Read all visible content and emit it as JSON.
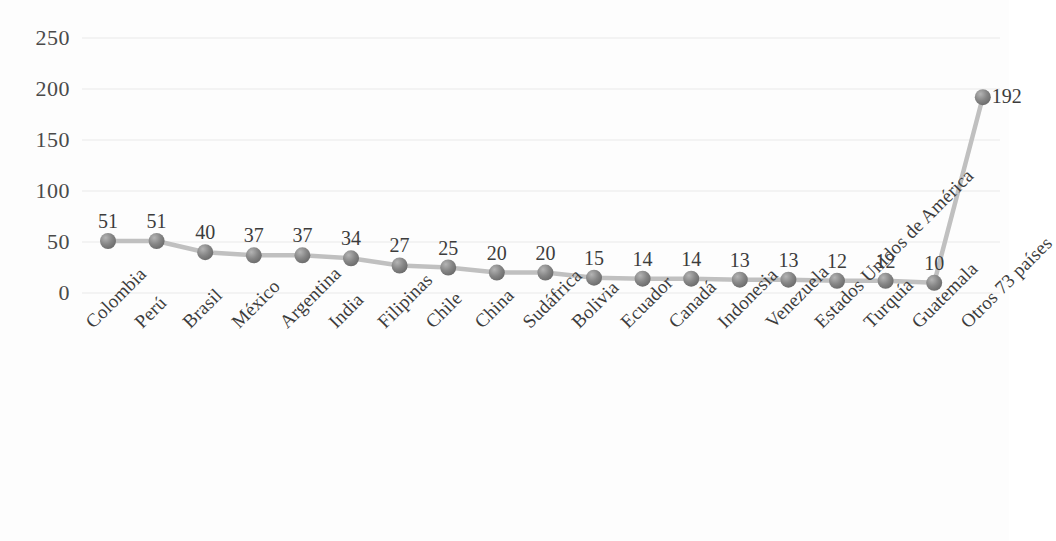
{
  "chart_data": {
    "type": "line",
    "title": "",
    "subtitle": "",
    "xlabel": "",
    "ylabel": "",
    "ylim": [
      0,
      250
    ],
    "yticks": [
      0,
      50,
      100,
      150,
      200,
      250
    ],
    "grid": true,
    "grid_axis": "y",
    "legend": false,
    "legend_position": "none",
    "marker": "circle",
    "marker_color": "#7f7f7f",
    "line_color": "#c0c0c0",
    "data_labels": true,
    "categories": [
      "Colombia",
      "Perú",
      "Brasil",
      "México",
      "Argentina",
      "India",
      "Filipinas",
      "Chile",
      "China",
      "Sudáfrica",
      "Bolivia",
      "Ecuador",
      "Canadá",
      "Indonesia",
      "Venezuela",
      "Estados Unidos de América",
      "Turquía",
      "Guatemala",
      "Otros 73 países"
    ],
    "values": [
      51,
      51,
      40,
      37,
      37,
      34,
      27,
      25,
      20,
      20,
      15,
      14,
      14,
      13,
      13,
      12,
      12,
      10,
      192
    ],
    "value_labels": [
      "51",
      "51",
      "40",
      "37",
      "37",
      "34",
      "27",
      "25",
      "20",
      "20",
      "15",
      "14",
      "14",
      "13",
      "13",
      "12",
      "12",
      "10",
      "192"
    ],
    "ytick_labels": [
      "0",
      "50",
      "100",
      "150",
      "200",
      "250"
    ]
  },
  "colors": {
    "marker": "#7f7f7f",
    "line": "#c0c0c0",
    "grid": "#efefef",
    "text": "#3c3c3c",
    "background": "#fdfdfd"
  }
}
